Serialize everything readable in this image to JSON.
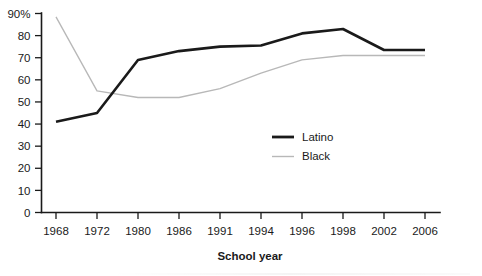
{
  "chart_data": {
    "type": "line",
    "title": "",
    "subtitle": "",
    "xlabel": "School year",
    "ylabel": "",
    "categories": [
      "1968",
      "1972",
      "1980",
      "1986",
      "1991",
      "1994",
      "1996",
      "1998",
      "2002",
      "2006"
    ],
    "series": [
      {
        "name": "Latino",
        "color": "#1a1a1a",
        "values": [
          41,
          45,
          69,
          73,
          75,
          75.5,
          81,
          83,
          73.5,
          73.5
        ]
      },
      {
        "name": "Black",
        "color": "#b8b8b8",
        "values": [
          88.5,
          55,
          52,
          52,
          56,
          63,
          69,
          71,
          71,
          71
        ]
      }
    ],
    "ylim": [
      0,
      90
    ],
    "yticks": [
      "0",
      "10",
      "20",
      "30",
      "40",
      "50",
      "60",
      "70",
      "80",
      "90%"
    ],
    "ytick_values": [
      0,
      10,
      20,
      30,
      40,
      50,
      60,
      70,
      80,
      90
    ],
    "grid": false,
    "legend_position": "inside-center-right"
  },
  "legend": {
    "entries": [
      {
        "label": "Latino"
      },
      {
        "label": "Black"
      }
    ]
  },
  "axes": {
    "x_title": "School year",
    "y_top_label": "90%"
  }
}
